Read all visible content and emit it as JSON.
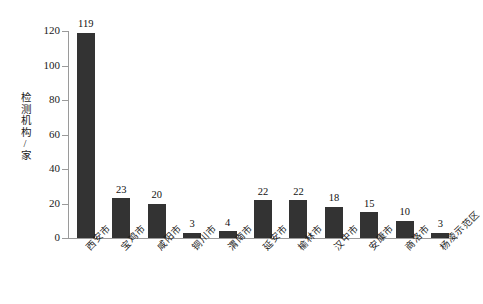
{
  "chart_data": {
    "type": "bar",
    "title": "",
    "xlabel": "",
    "ylabel": "检测机构/家",
    "ylim": [
      0,
      120
    ],
    "yticks": [
      0,
      20,
      40,
      60,
      80,
      100,
      120
    ],
    "grid": false,
    "legend": null,
    "bar_color": "#333333",
    "axis_color": "#9a9a9a",
    "categories": [
      "西安市",
      "宝鸡市",
      "咸阳市",
      "铜川市",
      "渭南市",
      "延安市",
      "榆林市",
      "汉中市",
      "安康市",
      "商洛市",
      "杨凌示范区"
    ],
    "values": [
      119,
      23,
      20,
      3,
      4,
      22,
      22,
      18,
      15,
      10,
      3
    ],
    "value_labels": [
      "119",
      "23",
      "20",
      "3",
      "4",
      "22",
      "22",
      "18",
      "15",
      "10",
      "3"
    ],
    "ytick_labels": [
      "0",
      "20",
      "40",
      "60",
      "80",
      "100",
      "120"
    ]
  }
}
